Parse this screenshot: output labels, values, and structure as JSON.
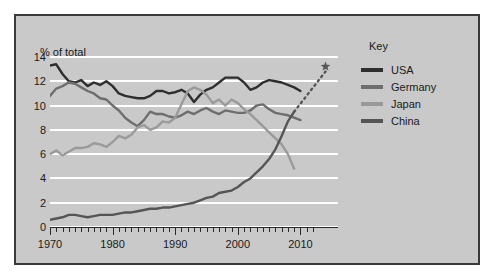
{
  "panel": {
    "background_color": "#c9c9c9",
    "border_color": "#3a3a3a"
  },
  "legend": {
    "title": "Key",
    "position": "right"
  },
  "chart_data": {
    "type": "line",
    "title": "",
    "subtitle": "",
    "xlabel": "",
    "ylabel": "% of total",
    "xlim": [
      1970,
      2016
    ],
    "ylim": [
      0,
      14
    ],
    "ytick_labels": [
      "0",
      "2",
      "4",
      "6",
      "8",
      "10",
      "12",
      "14"
    ],
    "yticks": [
      0,
      2,
      4,
      6,
      8,
      10,
      12,
      14
    ],
    "xtick_labels": [
      "1970",
      "1980",
      "1990",
      "2000",
      "2010"
    ],
    "xticks": [
      1970,
      1980,
      1990,
      2000,
      2010
    ],
    "xtick_minor_step": 1,
    "grid": "horizontal",
    "grid_color": "#ffffff",
    "legend_position": "right",
    "annotations": [
      {
        "name": "china-projection",
        "type": "dotted-line-with-star",
        "series": "China",
        "from": [
          2009,
          9.5
        ],
        "to": [
          2014,
          12.8
        ],
        "marker": "star"
      }
    ],
    "series": [
      {
        "name": "USA",
        "color": "#2e2e2e",
        "x": [
          1970,
          1971,
          1972,
          1973,
          1974,
          1975,
          1976,
          1977,
          1978,
          1979,
          1980,
          1981,
          1982,
          1983,
          1984,
          1985,
          1986,
          1987,
          1988,
          1989,
          1990,
          1991,
          1992,
          1993,
          1994,
          1995,
          1996,
          1997,
          1998,
          1999,
          2000,
          2001,
          2002,
          2003,
          2004,
          2005,
          2006,
          2007,
          2008,
          2009,
          2010
        ],
        "values": [
          13.3,
          13.4,
          12.6,
          12.0,
          11.9,
          12.1,
          11.6,
          11.9,
          11.7,
          12.0,
          11.6,
          11.0,
          10.8,
          10.7,
          10.6,
          10.6,
          10.8,
          11.2,
          11.2,
          11.0,
          11.1,
          11.3,
          11.0,
          10.3,
          10.9,
          11.3,
          11.5,
          11.9,
          12.3,
          12.3,
          12.3,
          11.9,
          11.3,
          11.5,
          11.9,
          12.1,
          12.0,
          11.9,
          11.7,
          11.5,
          11.2
        ]
      },
      {
        "name": "Germany",
        "color": "#6e6e6e",
        "x": [
          1970,
          1971,
          1972,
          1973,
          1974,
          1975,
          1976,
          1977,
          1978,
          1979,
          1980,
          1981,
          1982,
          1983,
          1984,
          1985,
          1986,
          1987,
          1988,
          1989,
          1990,
          1991,
          1992,
          1993,
          1994,
          1995,
          1996,
          1997,
          1998,
          1999,
          2000,
          2001,
          2002,
          2003,
          2004,
          2005,
          2006,
          2007,
          2008,
          2009,
          2010
        ],
        "values": [
          10.8,
          11.4,
          11.6,
          11.9,
          11.8,
          11.5,
          11.2,
          11.0,
          10.6,
          10.5,
          10.0,
          9.6,
          9.0,
          8.6,
          8.3,
          8.8,
          9.5,
          9.3,
          9.3,
          9.1,
          9.0,
          9.2,
          9.5,
          9.3,
          9.6,
          9.8,
          9.5,
          9.3,
          9.6,
          9.5,
          9.4,
          9.4,
          9.6,
          10.0,
          10.1,
          9.7,
          9.4,
          9.3,
          9.2,
          9.0,
          8.8
        ]
      },
      {
        "name": "Japan",
        "color": "#9a9a9a",
        "x": [
          1970,
          1971,
          1972,
          1973,
          1974,
          1975,
          1976,
          1977,
          1978,
          1979,
          1980,
          1981,
          1982,
          1983,
          1984,
          1985,
          1986,
          1987,
          1988,
          1989,
          1990,
          1991,
          1992,
          1993,
          1994,
          1995,
          1996,
          1997,
          1998,
          1999,
          2000,
          2001,
          2002,
          2003,
          2004,
          2005,
          2006,
          2007,
          2008,
          2009
        ],
        "values": [
          6.0,
          6.3,
          5.9,
          6.2,
          6.5,
          6.5,
          6.6,
          6.9,
          6.8,
          6.6,
          7.0,
          7.5,
          7.3,
          7.6,
          8.2,
          8.4,
          8.0,
          8.2,
          8.7,
          8.6,
          9.0,
          10.1,
          11.2,
          11.5,
          11.3,
          10.9,
          10.2,
          10.5,
          10.0,
          10.5,
          10.2,
          9.7,
          9.3,
          8.8,
          8.3,
          7.8,
          7.3,
          6.8,
          6.0,
          4.8
        ]
      },
      {
        "name": "China",
        "color": "#555555",
        "x": [
          1970,
          1971,
          1972,
          1973,
          1974,
          1975,
          1976,
          1977,
          1978,
          1979,
          1980,
          1981,
          1982,
          1983,
          1984,
          1985,
          1986,
          1987,
          1988,
          1989,
          1990,
          1991,
          1992,
          1993,
          1994,
          1995,
          1996,
          1997,
          1998,
          1999,
          2000,
          2001,
          2002,
          2003,
          2004,
          2005,
          2006,
          2007,
          2008,
          2009
        ],
        "values": [
          0.6,
          0.7,
          0.8,
          1.0,
          1.0,
          0.9,
          0.8,
          0.9,
          1.0,
          1.0,
          1.0,
          1.1,
          1.2,
          1.2,
          1.3,
          1.4,
          1.5,
          1.5,
          1.6,
          1.6,
          1.7,
          1.8,
          1.9,
          2.0,
          2.2,
          2.4,
          2.5,
          2.8,
          2.9,
          3.0,
          3.3,
          3.7,
          4.0,
          4.5,
          5.0,
          5.6,
          6.4,
          7.5,
          8.7,
          9.5
        ]
      }
    ]
  }
}
